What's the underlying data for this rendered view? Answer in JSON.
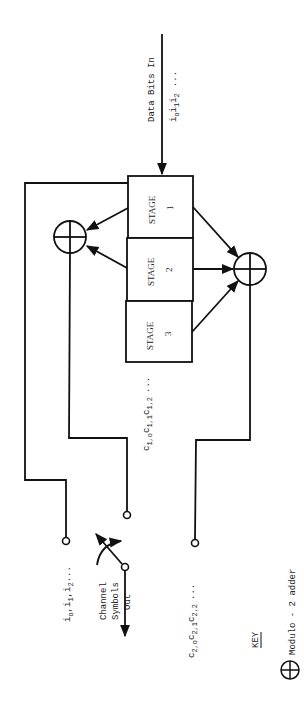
{
  "diagram": {
    "input": {
      "label": "Data Bits In",
      "sequence": "i",
      "sequence_subs": [
        "o",
        "1",
        "2"
      ],
      "ellipsis": "..."
    },
    "stages": [
      {
        "label": "STAGE",
        "number": "1"
      },
      {
        "label": "STAGE",
        "number": "2"
      },
      {
        "label": "STAGE",
        "number": "3"
      }
    ],
    "outputs": {
      "data_tap": {
        "base": "i",
        "subs": [
          "o",
          "1",
          "2"
        ],
        "ellipsis": "..."
      },
      "c1": {
        "base": "c",
        "subs": [
          "1,o",
          "1,1",
          "1,2"
        ],
        "ellipsis": "..."
      },
      "c2": {
        "base": "c",
        "subs": [
          "2,o",
          "2,1",
          "2,2"
        ],
        "ellipsis": "..."
      }
    },
    "switch": {
      "label_line1": "Channel",
      "label_line2": "Symbols",
      "label_line3": "Out"
    },
    "key": {
      "title": "KEY",
      "item_label": "Modulo - 2 adder"
    },
    "colors": {
      "line": "#111111",
      "background": "#ffffff"
    }
  }
}
